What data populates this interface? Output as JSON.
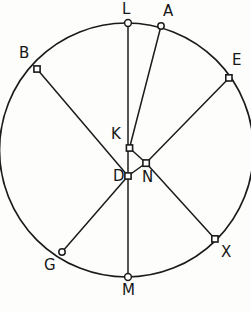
{
  "figure": {
    "type": "circle-with-chords-diagram",
    "canvas": {
      "width": 251,
      "height": 312
    },
    "background_color": "#fdfdfc",
    "stroke_color": "#1b1b1b",
    "marker_fill_color": "#ffffff",
    "circle": {
      "cx": 126.5,
      "cy": 150,
      "r": 127
    },
    "labels": {
      "L": "L",
      "A": "A",
      "E": "E",
      "X": "X",
      "M": "M",
      "G": "G",
      "B": "B",
      "K": "K",
      "D": "D",
      "N": "N"
    },
    "points": [
      {
        "id": "L",
        "label": "L",
        "x": 128,
        "y": 23,
        "marker": "circle",
        "on_circle": true,
        "label_x": 122,
        "label_y": 2
      },
      {
        "id": "A",
        "label": "A",
        "x": 161,
        "y": 26,
        "marker": "circle",
        "on_circle": true,
        "label_x": 163,
        "label_y": 4
      },
      {
        "id": "E",
        "label": "E",
        "x": 229,
        "y": 78,
        "marker": "square",
        "on_circle": true,
        "label_x": 232,
        "label_y": 53
      },
      {
        "id": "X",
        "label": "X",
        "x": 215,
        "y": 239,
        "marker": "square",
        "on_circle": true,
        "label_x": 221,
        "label_y": 245
      },
      {
        "id": "M",
        "label": "M",
        "x": 128,
        "y": 277,
        "marker": "circle",
        "on_circle": true,
        "label_x": 122,
        "label_y": 283
      },
      {
        "id": "G",
        "label": "G",
        "x": 62,
        "y": 252,
        "marker": "circle",
        "on_circle": true,
        "label_x": 44,
        "label_y": 258
      },
      {
        "id": "B",
        "label": "B",
        "x": 37,
        "y": 69,
        "marker": "square",
        "on_circle": true,
        "label_x": 19,
        "label_y": 46
      },
      {
        "id": "K",
        "label": "K",
        "x": 129.5,
        "y": 148,
        "marker": "square",
        "on_circle": false,
        "label_x": 111,
        "label_y": 127
      },
      {
        "id": "N",
        "label": "N",
        "x": 146,
        "y": 163,
        "marker": "square",
        "on_circle": false,
        "label_x": 142,
        "label_y": 170
      },
      {
        "id": "D",
        "label": "D",
        "x": 128,
        "y": 176,
        "marker": "square",
        "on_circle": false,
        "label_x": 113,
        "label_y": 169
      }
    ],
    "segments": [
      {
        "id": "L-M",
        "from": "L",
        "to": "M",
        "desc": "vertical diameter through K and D"
      },
      {
        "id": "A-K",
        "from": "A",
        "to": "K",
        "desc": "chord from A down to interior point K"
      },
      {
        "id": "K-N",
        "from": "K",
        "to": "N",
        "desc": "short interior segment"
      },
      {
        "id": "K-D",
        "from": "K",
        "to": "D",
        "desc": "short interior segment along vertical"
      },
      {
        "id": "E-N",
        "from": "E",
        "to": "N",
        "desc": "chord from E down-left to N"
      },
      {
        "id": "N-D",
        "from": "N",
        "to": "D",
        "desc": "short interior segment"
      },
      {
        "id": "N-X",
        "from": "N",
        "to": "X",
        "desc": "chord from N down-right to X"
      },
      {
        "id": "B-D",
        "from": "B",
        "to": "D",
        "desc": "chord from B down-right to D"
      },
      {
        "id": "D-N2",
        "from": "D",
        "to": "N",
        "desc": "continuation to N"
      },
      {
        "id": "G-D",
        "from": "G",
        "to": "D",
        "desc": "chord from G up-right to D"
      }
    ]
  }
}
